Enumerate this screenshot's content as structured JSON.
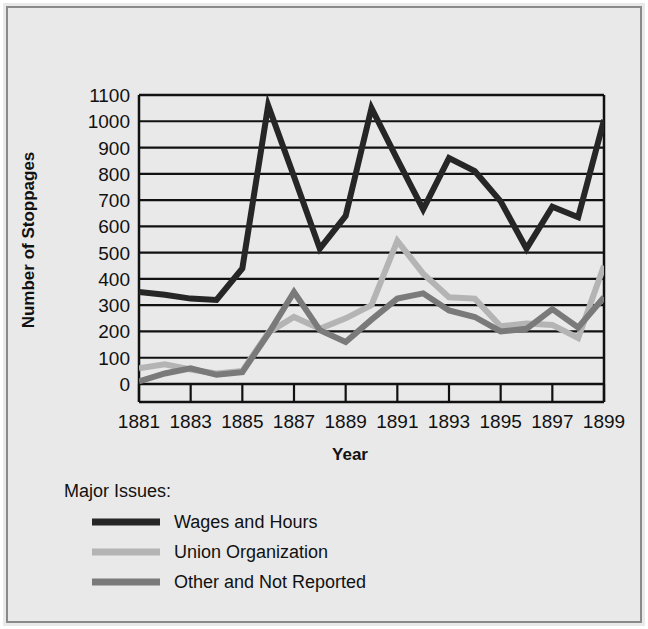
{
  "chart_data": {
    "type": "line",
    "title": "",
    "xlabel": "Year",
    "ylabel": "Number of Stoppages",
    "legend_title": "Major Issues:",
    "legend_position": "below-plot-left",
    "grid": true,
    "xlim": [
      1881,
      1899
    ],
    "ylim": [
      0,
      1100
    ],
    "yticks": [
      0,
      100,
      200,
      300,
      400,
      500,
      600,
      700,
      800,
      900,
      1000,
      1100
    ],
    "ytick_labels": [
      "0",
      "100",
      "200",
      "300",
      "400",
      "500",
      "600",
      "700",
      "800",
      "900",
      "1000",
      "1100"
    ],
    "x": [
      1881,
      1882,
      1883,
      1884,
      1885,
      1886,
      1887,
      1888,
      1889,
      1890,
      1891,
      1892,
      1893,
      1894,
      1895,
      1896,
      1897,
      1898,
      1899
    ],
    "xticks": [
      1881,
      1883,
      1885,
      1887,
      1889,
      1891,
      1893,
      1895,
      1897,
      1899
    ],
    "xtick_labels": [
      "1881",
      "1883",
      "1885",
      "1887",
      "1889",
      "1891",
      "1893",
      "1895",
      "1897",
      "1899"
    ],
    "series": [
      {
        "name": "Wages and Hours",
        "color": "#262626",
        "values": [
          350,
          340,
          325,
          320,
          440,
          1060,
          790,
          515,
          640,
          1050,
          855,
          665,
          860,
          810,
          695,
          515,
          675,
          635,
          1005
        ]
      },
      {
        "name": "Union Organization",
        "color": "#b4b4b4",
        "values": [
          60,
          75,
          55,
          40,
          50,
          195,
          255,
          210,
          250,
          300,
          545,
          420,
          330,
          325,
          220,
          230,
          225,
          175,
          450
        ]
      },
      {
        "name": "Other and Not Reported",
        "color": "#7a7a7a",
        "values": [
          10,
          40,
          60,
          35,
          45,
          190,
          350,
          205,
          160,
          245,
          325,
          345,
          280,
          255,
          200,
          210,
          285,
          215,
          330
        ]
      }
    ]
  },
  "axis": {
    "ylabel": "Number of Stoppages",
    "xlabel": "Year"
  },
  "legend": {
    "heading": "Major Issues:",
    "items": [
      {
        "label": "Wages and Hours",
        "color": "#262626"
      },
      {
        "label": "Union Organization",
        "color": "#b4b4b4"
      },
      {
        "label": "Other and Not Reported",
        "color": "#7a7a7a"
      }
    ]
  },
  "colors": {
    "background": "#e9e9e9",
    "frame": "#8a8a8a",
    "axis": "#111111",
    "grid": "#111111"
  }
}
